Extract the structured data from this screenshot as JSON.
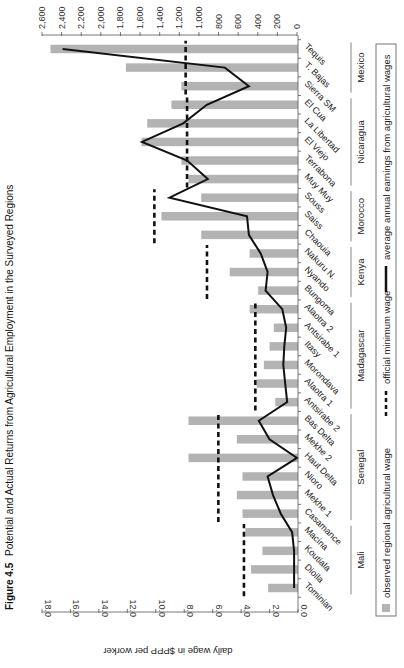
{
  "figure": {
    "number": "Figure 4.5",
    "title": "Potential and Actual Returns from Agricultural Employment in the Surveyed Regions"
  },
  "colors": {
    "bar": "#b3b3b3",
    "line": "#111111",
    "min_wage": "#111111",
    "axis": "#555555"
  },
  "chart_data": {
    "type": "bar",
    "title": "Figure 4.5 Potential and Actual Returns from Agricultural Employment in the Surveyed Regions",
    "xlabel": "",
    "ylabel": "daily wage in $PPP per worker",
    "y2label": "",
    "ylim": [
      0,
      18
    ],
    "y2lim": [
      0,
      2600
    ],
    "yticks": [
      "0.0",
      "2.0",
      "4.0",
      "6.0",
      "8.0",
      "10.0",
      "12.0",
      "14.0",
      "16.0",
      "18.0"
    ],
    "y2ticks": [
      "0",
      "200",
      "400",
      "600",
      "800",
      "1,000",
      "1,200",
      "1,400",
      "1,600",
      "1,800",
      "2,000",
      "2,200",
      "2,400",
      "2,600"
    ],
    "orientation_note": "rendered rotated 90 degrees",
    "categories": [
      "Tominian",
      "Dioila",
      "Koutiala",
      "Macina",
      "Casamance",
      "Mekhe 1",
      "Nioro",
      "Haut Delta",
      "Mekhe 2",
      "Bas Delta",
      "Antsirabe 2",
      "Alaotra 1",
      "Morondava",
      "Itasy",
      "Antsirabe 1",
      "Alaotra 2",
      "Bungoma",
      "Nyando",
      "Nakuru N.",
      "Chaouia",
      "Saiss",
      "Souss",
      "Muy Muy",
      "Terrabona",
      "El Viejo",
      "La Libertad",
      "El Cua",
      "Sierra SM",
      "T. Bajas",
      "Tequis"
    ],
    "groups": [
      {
        "name": "Mali",
        "start": 0,
        "end": 3
      },
      {
        "name": "Senegal",
        "start": 4,
        "end": 9
      },
      {
        "name": "Madagascar",
        "start": 10,
        "end": 15
      },
      {
        "name": "Kenya",
        "start": 16,
        "end": 18
      },
      {
        "name": "Morocco",
        "start": 19,
        "end": 21
      },
      {
        "name": "Nicaragua",
        "start": 22,
        "end": 26
      },
      {
        "name": "Mexico",
        "start": 27,
        "end": 29
      }
    ],
    "series": [
      {
        "name": "observed regional agricultural wage",
        "type": "bar",
        "axis": "left",
        "values": [
          2.1,
          3.3,
          2.5,
          3.7,
          3.9,
          4.3,
          3.9,
          7.7,
          4.3,
          7.7,
          1.6,
          2.9,
          2.4,
          2.0,
          1.7,
          3.4,
          2.8,
          4.8,
          3.4,
          6.8,
          9.6,
          6.8,
          7.7,
          8.2,
          11.0,
          10.6,
          8.9,
          8.2,
          12.1,
          17.4
        ]
      },
      {
        "name": "official minimum wage",
        "type": "dashed-segment",
        "axis": "left",
        "segments": [
          {
            "group": "Mali",
            "value": 3.8
          },
          {
            "group": "Senegal",
            "value": 5.6
          },
          {
            "group": "Madagascar",
            "value": 3.0
          },
          {
            "group": "Kenya",
            "value": 6.4
          },
          {
            "group": "Morocco",
            "value": 10.1
          },
          {
            "group": "Nicaragua",
            "value": 7.8
          },
          {
            "group": "Mexico",
            "value": 7.9
          }
        ]
      },
      {
        "name": "average annual earnings from agricultural wages",
        "type": "line",
        "axis": "right",
        "values": [
          30,
          30,
          30,
          50,
          165,
          245,
          300,
          0,
          280,
          390,
          100,
          120,
          140,
          130,
          110,
          150,
          320,
          300,
          370,
          490,
          510,
          1300,
          910,
          1120,
          1580,
          1160,
          920,
          490,
          735,
          2390
        ]
      }
    ],
    "legend": {
      "position": "bottom",
      "entries": [
        "observed regional agricultural wage",
        "official minimum wage",
        "average annual earnings from agricultural wages"
      ]
    },
    "grid": false
  }
}
